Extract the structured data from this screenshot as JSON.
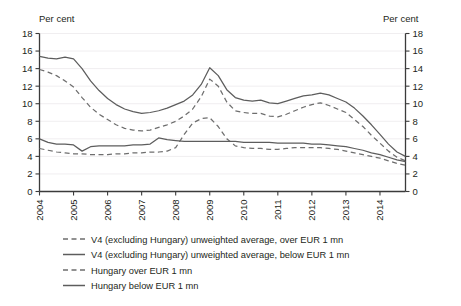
{
  "chart_data": {
    "type": "line",
    "title": "",
    "xlabel": "",
    "ylabel": "Per cent",
    "ylabel_right": "Per cent",
    "ylim": [
      0,
      18
    ],
    "ytick_step": 2,
    "yticks": [
      0,
      2,
      4,
      6,
      8,
      10,
      12,
      14,
      16,
      18
    ],
    "xticks": [
      "2004",
      "2005",
      "2006",
      "2007",
      "2008",
      "2009",
      "2010",
      "2011",
      "2012",
      "2013",
      "2014"
    ],
    "xlim": [
      2004,
      2014.75
    ],
    "grid": true,
    "grid_axis": "y",
    "legend_position": "below",
    "series": [
      {
        "name": "V4 (excluding Hungary) unweighted average, over EUR 1 mn",
        "style": "dashed",
        "color": "#6e6e6e",
        "x": [
          2004.0,
          2004.25,
          2004.5,
          2004.75,
          2005.0,
          2005.25,
          2005.5,
          2005.75,
          2006.0,
          2006.25,
          2006.5,
          2006.75,
          2007.0,
          2007.25,
          2007.5,
          2007.75,
          2008.0,
          2008.25,
          2008.5,
          2008.75,
          2009.0,
          2009.25,
          2009.5,
          2009.75,
          2010.0,
          2010.25,
          2010.5,
          2010.75,
          2011.0,
          2011.25,
          2011.5,
          2011.75,
          2012.0,
          2012.25,
          2012.5,
          2012.75,
          2013.0,
          2013.25,
          2013.5,
          2013.75,
          2014.0,
          2014.25,
          2014.5,
          2014.75
        ],
        "values": [
          13.9,
          13.6,
          13.2,
          12.6,
          11.9,
          10.7,
          9.6,
          8.8,
          8.2,
          7.6,
          7.2,
          7.0,
          6.9,
          7.0,
          7.3,
          7.6,
          8.0,
          8.6,
          9.4,
          10.8,
          12.8,
          12.0,
          10.2,
          9.2,
          9.0,
          8.9,
          8.9,
          8.6,
          8.5,
          8.8,
          9.2,
          9.6,
          9.9,
          10.1,
          9.8,
          9.4,
          9.0,
          8.2,
          7.4,
          6.4,
          5.5,
          4.6,
          3.9,
          3.5
        ]
      },
      {
        "name": "V4 (excluding Hungary) unweighted average, below EUR 1 mn",
        "style": "solid",
        "color": "#5d5d5d",
        "x": [
          2004.0,
          2004.25,
          2004.5,
          2004.75,
          2005.0,
          2005.25,
          2005.5,
          2005.75,
          2006.0,
          2006.25,
          2006.5,
          2006.75,
          2007.0,
          2007.25,
          2007.5,
          2007.75,
          2008.0,
          2008.25,
          2008.5,
          2008.75,
          2009.0,
          2009.25,
          2009.5,
          2009.75,
          2010.0,
          2010.25,
          2010.5,
          2010.75,
          2011.0,
          2011.25,
          2011.5,
          2011.75,
          2012.0,
          2012.25,
          2012.5,
          2012.75,
          2013.0,
          2013.25,
          2013.5,
          2013.75,
          2014.0,
          2014.25,
          2014.5,
          2014.75
        ],
        "values": [
          15.4,
          15.2,
          15.1,
          15.3,
          15.1,
          14.0,
          12.6,
          11.5,
          10.6,
          9.9,
          9.4,
          9.1,
          8.9,
          9.0,
          9.2,
          9.5,
          9.9,
          10.3,
          11.0,
          12.2,
          14.1,
          13.2,
          11.6,
          10.7,
          10.4,
          10.3,
          10.4,
          10.1,
          10.0,
          10.3,
          10.6,
          10.9,
          11.0,
          11.2,
          11.0,
          10.6,
          10.2,
          9.5,
          8.6,
          7.6,
          6.5,
          5.4,
          4.5,
          4.0
        ]
      },
      {
        "name": "Hungary over EUR 1 mn",
        "style": "dashed",
        "color": "#6e6e6e",
        "x": [
          2004.0,
          2004.25,
          2004.5,
          2004.75,
          2005.0,
          2005.25,
          2005.5,
          2005.75,
          2006.0,
          2006.25,
          2006.5,
          2006.75,
          2007.0,
          2007.25,
          2007.5,
          2007.75,
          2008.0,
          2008.25,
          2008.5,
          2008.75,
          2009.0,
          2009.25,
          2009.5,
          2009.75,
          2010.0,
          2010.25,
          2010.5,
          2010.75,
          2011.0,
          2011.25,
          2011.5,
          2011.75,
          2012.0,
          2012.25,
          2012.5,
          2012.75,
          2013.0,
          2013.25,
          2013.5,
          2013.75,
          2014.0,
          2014.25,
          2014.5,
          2014.75
        ],
        "values": [
          4.9,
          4.7,
          4.5,
          4.4,
          4.3,
          4.3,
          4.2,
          4.2,
          4.2,
          4.3,
          4.3,
          4.4,
          4.4,
          4.5,
          4.5,
          4.6,
          5.0,
          6.5,
          7.8,
          8.3,
          8.4,
          7.4,
          6.0,
          5.2,
          5.0,
          4.9,
          4.9,
          4.8,
          4.8,
          4.9,
          5.0,
          5.0,
          5.0,
          5.0,
          4.9,
          4.8,
          4.6,
          4.4,
          4.2,
          4.0,
          3.8,
          3.5,
          3.2,
          3.0
        ]
      },
      {
        "name": "Hungary below EUR 1 mn",
        "style": "solid",
        "color": "#5d5d5d",
        "x": [
          2004.0,
          2004.25,
          2004.5,
          2004.75,
          2005.0,
          2005.25,
          2005.5,
          2005.75,
          2006.0,
          2006.25,
          2006.5,
          2006.75,
          2007.0,
          2007.25,
          2007.5,
          2007.75,
          2008.0,
          2008.25,
          2008.5,
          2008.75,
          2009.0,
          2009.25,
          2009.5,
          2009.75,
          2010.0,
          2010.25,
          2010.5,
          2010.75,
          2011.0,
          2011.25,
          2011.5,
          2011.75,
          2012.0,
          2012.25,
          2012.5,
          2012.75,
          2013.0,
          2013.25,
          2013.5,
          2013.75,
          2014.0,
          2014.25,
          2014.5,
          2014.75
        ],
        "values": [
          6.0,
          5.6,
          5.4,
          5.4,
          5.3,
          4.6,
          5.1,
          5.2,
          5.2,
          5.2,
          5.2,
          5.3,
          5.3,
          5.4,
          6.1,
          5.9,
          5.8,
          5.7,
          5.7,
          5.7,
          5.7,
          5.7,
          5.7,
          5.7,
          5.6,
          5.6,
          5.6,
          5.6,
          5.5,
          5.5,
          5.5,
          5.5,
          5.4,
          5.4,
          5.3,
          5.2,
          5.1,
          4.9,
          4.7,
          4.4,
          4.2,
          3.9,
          3.6,
          3.4
        ]
      }
    ]
  },
  "legend": {
    "items": [
      {
        "label": "V4 (excluding Hungary) unweighted average, over EUR 1 mn",
        "style": "dashed"
      },
      {
        "label": "V4 (excluding Hungary) unweighted average, below EUR 1 mn",
        "style": "solid"
      },
      {
        "label": "Hungary over EUR 1 mn",
        "style": "dashed"
      },
      {
        "label": "Hungary below EUR 1 mn",
        "style": "solid"
      }
    ]
  },
  "colors": {
    "line": "#5d5d5d",
    "line_dashed": "#6e6e6e",
    "axis": "#3b3b3b",
    "grid": "#f0eef0",
    "text": "#231f20",
    "background": "#ffffff"
  }
}
